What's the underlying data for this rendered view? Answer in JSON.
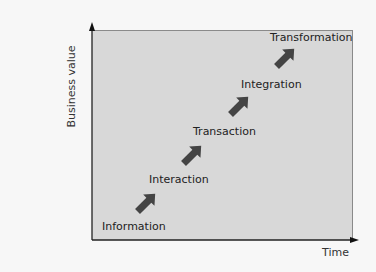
{
  "diagram": {
    "type": "staircase-progression",
    "axes": {
      "y_label": "Business value",
      "x_label": "Time"
    },
    "stages": [
      {
        "label": "Information"
      },
      {
        "label": "Interaction"
      },
      {
        "label": "Transaction"
      },
      {
        "label": "Integration"
      },
      {
        "label": "Transformation"
      }
    ],
    "arrow_count": 4,
    "colors": {
      "background": "#f7f7f7",
      "plot_fill": "#d8d8d8",
      "arrow": "#444444",
      "axis": "#222222"
    }
  }
}
